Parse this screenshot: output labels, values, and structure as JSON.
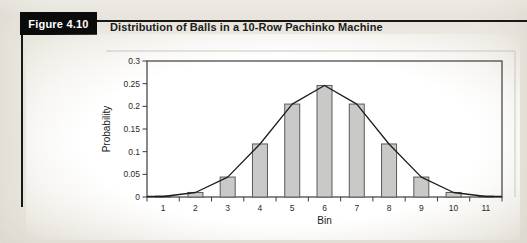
{
  "figure": {
    "label": "Figure 4.10",
    "title": "Distribution of Balls in a 10-Row Pachinko Machine"
  },
  "chart_data": {
    "type": "bar",
    "title": "",
    "categories": [
      "1",
      "2",
      "3",
      "4",
      "5",
      "6",
      "7",
      "8",
      "9",
      "10",
      "11"
    ],
    "values": [
      0.001,
      0.01,
      0.044,
      0.117,
      0.205,
      0.246,
      0.205,
      0.117,
      0.044,
      0.01,
      0.001
    ],
    "overlay": {
      "type": "line",
      "description": "frequency polygon connecting bar tops",
      "values": [
        0.001,
        0.01,
        0.044,
        0.117,
        0.205,
        0.246,
        0.205,
        0.117,
        0.044,
        0.01,
        0.001
      ]
    },
    "xlabel": "Bin",
    "ylabel": "Probability",
    "ylim": [
      0,
      0.3
    ],
    "yticks": [
      {
        "value": 0,
        "label": "0"
      },
      {
        "value": 0.05,
        "label": "0.05"
      },
      {
        "value": 0.1,
        "label": "0.1"
      },
      {
        "value": 0.15,
        "label": "0.15"
      },
      {
        "value": 0.2,
        "label": "0.2"
      },
      {
        "value": 0.25,
        "label": "0.25"
      },
      {
        "value": 0.3,
        "label": "0.3"
      }
    ],
    "grid": false,
    "legend": "none"
  },
  "colors": {
    "page_bg": "#eeebe4",
    "chart_bg": "#ffffff",
    "figure_label_bg": "#0b0b0b",
    "figure_label_text": "#ffffff",
    "rule": "#181818",
    "bar_fill": "#c9c9c7",
    "bar_stroke": "#5a5a5a",
    "frame": "#3c3c3c",
    "line": "#1c1c1c",
    "text": "#2a2a2a",
    "outer_border": "#c9c6be"
  }
}
